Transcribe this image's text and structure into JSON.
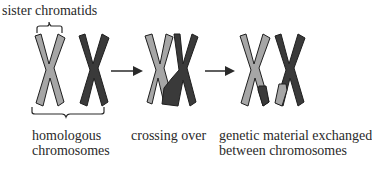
{
  "labels": {
    "sister_chromatids": "sister chromatids",
    "homologous_line1": "homologous",
    "homologous_line2": "chromosomes",
    "crossing_over": "crossing over",
    "exchanged_line1": "genetic material exchanged",
    "exchanged_line2": "between chromosomes"
  },
  "colors": {
    "light_chromosome": "#a6a6a6",
    "dark_chromosome": "#3a3a3a",
    "outline": "#1e1e1e",
    "arrow": "#2a2a2a",
    "text": "#2a2a2a"
  },
  "stages": [
    {
      "name": "homologous chromosomes"
    },
    {
      "name": "crossing over"
    },
    {
      "name": "genetic material exchanged between chromosomes"
    }
  ]
}
